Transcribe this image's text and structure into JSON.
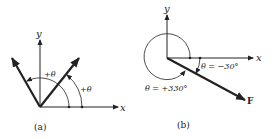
{
  "figure_a": {
    "x_label": "x",
    "y_label": "y",
    "angle_inner_label": "+θ",
    "angle_outer_label": "+θ",
    "caption": "(a)"
  },
  "figure_b": {
    "x_label": "x",
    "y_label": "y",
    "angle_neg_label": "θ = −30°",
    "angle_pos_label": "θ = +330°",
    "force_label": "F",
    "caption": "(b)"
  },
  "colors": {
    "ink": "#222222",
    "background": "#ffffff"
  }
}
